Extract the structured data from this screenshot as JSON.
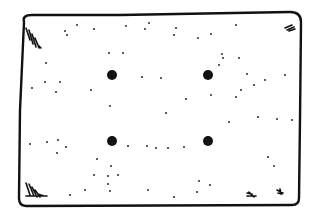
{
  "drawing": {
    "width": 318,
    "height": 215,
    "stroke_color": "#111111",
    "background": "#ffffff",
    "outline_path": "M24,22 Q22,15 32,15 L120,15 L290,12 Q301,12 301,22 L300,120 L299,198 Q299,205 292,205 L26,206 Q19,206 19,198 L20,110 Z",
    "big_dots": [
      {
        "cx": 112,
        "cy": 75,
        "r": 5
      },
      {
        "cx": 208,
        "cy": 75,
        "r": 5
      },
      {
        "cx": 112,
        "cy": 141,
        "r": 5
      },
      {
        "cx": 208,
        "cy": 141,
        "r": 5
      }
    ],
    "small_dots": [
      [
        65,
        31
      ],
      [
        77,
        25
      ],
      [
        94,
        29
      ],
      [
        67,
        35
      ],
      [
        126,
        26
      ],
      [
        145,
        29
      ],
      [
        149,
        23
      ],
      [
        109,
        53
      ],
      [
        123,
        53
      ],
      [
        46,
        63
      ],
      [
        32,
        88
      ],
      [
        45,
        82
      ],
      [
        60,
        82
      ],
      [
        56,
        92
      ],
      [
        91,
        90
      ],
      [
        110,
        106
      ],
      [
        142,
        77
      ],
      [
        161,
        78
      ],
      [
        174,
        35
      ],
      [
        176,
        28
      ],
      [
        198,
        38
      ],
      [
        211,
        34
      ],
      [
        236,
        25
      ],
      [
        222,
        54
      ],
      [
        223,
        58
      ],
      [
        219,
        65
      ],
      [
        239,
        58
      ],
      [
        247,
        74
      ],
      [
        285,
        75
      ],
      [
        241,
        90
      ],
      [
        254,
        85
      ],
      [
        265,
        80
      ],
      [
        236,
        97
      ],
      [
        211,
        95
      ],
      [
        186,
        99
      ],
      [
        166,
        113
      ],
      [
        30,
        144
      ],
      [
        47,
        142
      ],
      [
        58,
        140
      ],
      [
        66,
        147
      ],
      [
        57,
        153
      ],
      [
        97,
        159
      ],
      [
        111,
        166
      ],
      [
        108,
        176
      ],
      [
        94,
        175
      ],
      [
        108,
        184
      ],
      [
        118,
        175
      ],
      [
        110,
        191
      ],
      [
        70,
        195
      ],
      [
        85,
        190
      ],
      [
        147,
        146
      ],
      [
        156,
        148
      ],
      [
        229,
        122
      ],
      [
        258,
        117
      ],
      [
        277,
        119
      ],
      [
        292,
        120
      ],
      [
        268,
        157
      ],
      [
        274,
        166
      ],
      [
        199,
        181
      ],
      [
        210,
        185
      ],
      [
        197,
        192
      ],
      [
        174,
        197
      ],
      [
        168,
        148
      ],
      [
        184,
        147
      ],
      [
        148,
        190
      ],
      [
        128,
        146
      ]
    ],
    "corner_marks": [
      {
        "name": "top-left-hatch",
        "path": "M26,28 L30,40 M29,30 L33,44 M32,34 L36,47 M35,38 L39,48 M37,44 L41,48"
      },
      {
        "name": "top-right-hatch",
        "path": "M285,28 L292,25 M287,30 L294,27 M289,31 L295,29"
      },
      {
        "name": "bottom-left-hatch",
        "path": "M26,183 L30,195 M29,184 L34,196 M32,187 L37,197 M35,190 L40,197 M38,194 L44,196 M26,196 L47,196"
      },
      {
        "name": "bottom-right-hatch-1",
        "path": "M247,193 L252,194 M247,196 L256,196 M249,192 L254,197"
      },
      {
        "name": "bottom-right-hatch-2",
        "path": "M277,190 L283,193 M278,193 L282,194 M280,189 L281,194"
      }
    ]
  }
}
